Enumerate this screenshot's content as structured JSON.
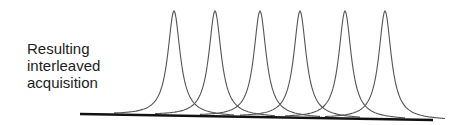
{
  "diagram": {
    "label_line1": "Resulting interleaved",
    "label_line2": "acquisition",
    "peaks": [
      174,
      215,
      260,
      300,
      345,
      385
    ],
    "baseline": {
      "x1": 80,
      "y1": 114,
      "x2": 433,
      "y2": 120
    },
    "colors": {
      "curve": "#555555",
      "baseline": "#111111",
      "text": "#222222"
    }
  }
}
